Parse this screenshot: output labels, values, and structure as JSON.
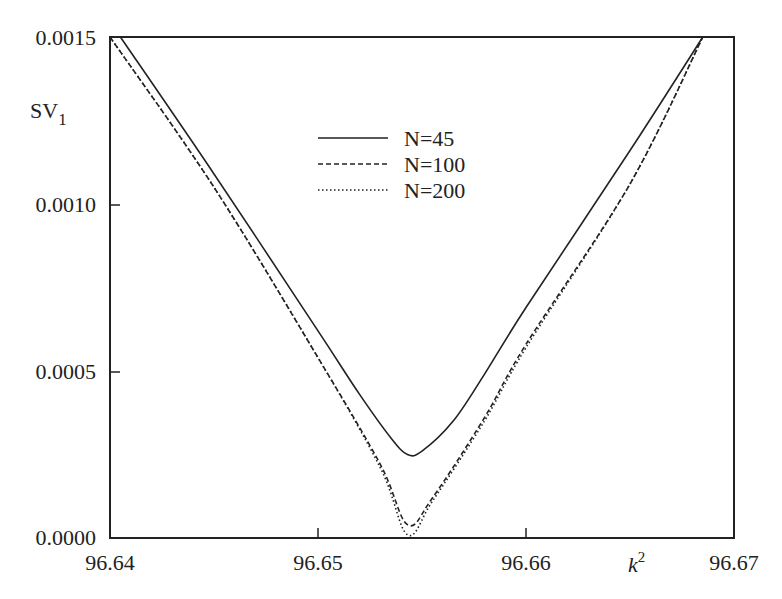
{
  "chart_data": {
    "type": "line",
    "title": "",
    "xlabel": "k^2",
    "ylabel": "SV_1",
    "xlim": [
      96.64,
      96.67
    ],
    "ylim": [
      0.0,
      0.0015
    ],
    "grid": false,
    "legend_position": "upper center",
    "x_ticks": [
      "96.64",
      "96.65",
      "96.66",
      "96.67"
    ],
    "y_ticks": [
      "0.0000",
      "0.0005",
      "0.0010",
      "0.0015"
    ],
    "series": [
      {
        "name": "N=45",
        "style": "solid",
        "x": [
          96.6405,
          96.645,
          96.65,
          96.652,
          96.6535,
          96.6543,
          96.655,
          96.6565,
          96.658,
          96.66,
          96.665,
          96.6685
        ],
        "y": [
          0.0015,
          0.00109,
          0.00062,
          0.00043,
          0.0003,
          0.00025,
          0.00026,
          0.00035,
          0.00049,
          0.00069,
          0.00116,
          0.0015
        ]
      },
      {
        "name": "N=100",
        "style": "dashed",
        "x": [
          96.64,
          96.645,
          96.65,
          96.653,
          96.6543,
          96.6555,
          96.658,
          96.66,
          96.665,
          96.6685
        ],
        "y": [
          0.0015,
          0.00105,
          0.00054,
          0.00022,
          4e-05,
          0.00012,
          0.00036,
          0.00058,
          0.00106,
          0.0015
        ]
      },
      {
        "name": "N=200",
        "style": "dotted",
        "x": [
          96.64,
          96.645,
          96.65,
          96.653,
          96.6543,
          96.6555,
          96.658,
          96.66,
          96.665,
          96.6685
        ],
        "y": [
          0.0015,
          0.00105,
          0.00054,
          0.00021,
          1e-05,
          0.00011,
          0.00035,
          0.00057,
          0.00106,
          0.0015
        ]
      }
    ]
  },
  "labels": {
    "ylabel_main": "SV",
    "ylabel_sub": "1",
    "xlabel_main": "k",
    "xlabel_sup": "2",
    "legend": [
      "N=45",
      "N=100",
      "N=200"
    ],
    "x_ticks": [
      "96.64",
      "96.65",
      "96.66",
      "96.67"
    ],
    "y_ticks": [
      "0.0000",
      "0.0005",
      "0.0010",
      "0.0015"
    ]
  }
}
